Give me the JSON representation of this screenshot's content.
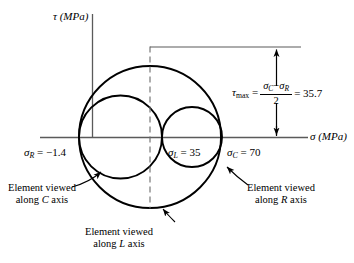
{
  "figure": {
    "type": "mohr-circle-diagram",
    "axes": {
      "vertical_label": "τ (MPa)",
      "horizontal_label": "σ (MPa)"
    },
    "points": {
      "sigma_R": {
        "symbol": "σ",
        "subscript": "R",
        "text": "= −1.4",
        "value": -1.4
      },
      "sigma_L": {
        "symbol": "σ",
        "subscript": "L",
        "text": "= 35",
        "value": 35
      },
      "sigma_C": {
        "symbol": "σ",
        "subscript": "C",
        "text": "= 70",
        "value": 70
      }
    },
    "tau_max": {
      "symbol": "τ",
      "subscript": "max",
      "equals": "=",
      "numerator_a": "σ",
      "numerator_a_sub": "C",
      "numerator_minus": "−",
      "numerator_b": "σ",
      "numerator_b_sub": "R",
      "denominator": "2",
      "result": "= 35.7",
      "value": 35.7
    },
    "annotations": [
      {
        "line1": "Element viewed",
        "line2_pre": "along ",
        "line2_var": "C",
        "line2_post": " axis"
      },
      {
        "line1": "Element viewed",
        "line2_pre": "along ",
        "line2_var": "R",
        "line2_post": " axis"
      },
      {
        "line1": "Element viewed",
        "line2_pre": "along ",
        "line2_var": "L",
        "line2_post": " axis"
      }
    ],
    "colors": {
      "stroke": "#000000",
      "axis": "#555555",
      "background": "#ffffff"
    },
    "geometry": {
      "big_circle": {
        "cx": 150,
        "cy": 137,
        "r": 71
      },
      "left_circle": {
        "cx": 120,
        "cy": 137,
        "r": 42
      },
      "right_circle": {
        "cx": 192,
        "cy": 137,
        "r": 30
      }
    }
  }
}
